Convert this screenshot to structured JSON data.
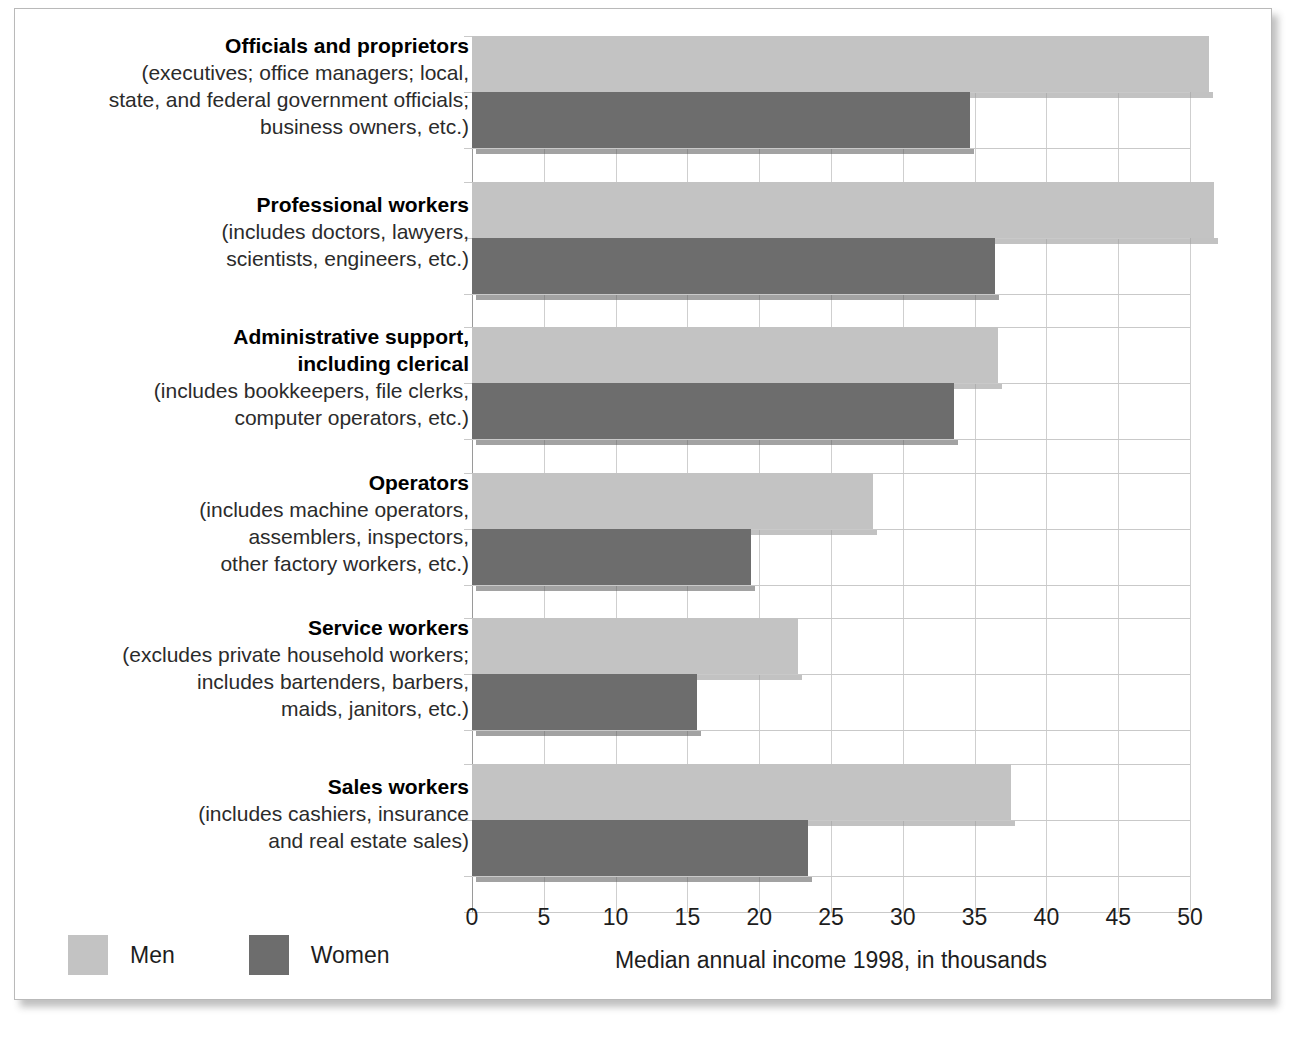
{
  "chart_data": {
    "type": "bar",
    "orientation": "horizontal",
    "title": "",
    "xlabel": "Median annual income 1998, in thousands",
    "ylabel": "",
    "xlim": [
      0,
      52.5
    ],
    "xticks": [
      0,
      5,
      10,
      15,
      20,
      25,
      30,
      35,
      40,
      45,
      50
    ],
    "xticklabels": [
      "0",
      "5",
      "10",
      "15",
      "20",
      "25",
      "30",
      "35",
      "40",
      "45",
      "50"
    ],
    "grid": "vertical",
    "legend_position": "bottom-left",
    "categories": [
      "Officials and proprietors",
      "Professional workers",
      "Administrative support, including clerical",
      "Operators",
      "Service workers",
      "Sales workers"
    ],
    "series": [
      {
        "name": "Men",
        "color": "#c3c3c3",
        "values": [
          51.3,
          51.7,
          36.6,
          27.9,
          22.7,
          37.5
        ]
      },
      {
        "name": "Women",
        "color": "#6d6d6d",
        "values": [
          34.7,
          36.4,
          33.6,
          19.4,
          15.7,
          23.4
        ]
      }
    ]
  },
  "axis": {
    "xlabel": "Median annual income 1998, in thousands",
    "ticks": [
      "0",
      "5",
      "10",
      "15",
      "20",
      "25",
      "30",
      "35",
      "40",
      "45",
      "50"
    ]
  },
  "legend": {
    "items": [
      {
        "label": "Men",
        "swatch": "men-swatch"
      },
      {
        "label": "Women",
        "swatch": "women-swatch"
      }
    ]
  },
  "rows": [
    {
      "title": "Officials and proprietors",
      "sub": [
        "(executives; office managers; local,",
        "state, and federal government officials;",
        "business owners, etc.)"
      ],
      "men": 51.3,
      "women": 34.7
    },
    {
      "title": "Professional workers",
      "sub": [
        "(includes doctors, lawyers,",
        "scientists, engineers, etc.)"
      ],
      "men": 51.7,
      "women": 36.4
    },
    {
      "title": "Administrative support,",
      "title2": "including clerical",
      "sub": [
        "(includes bookkeepers, file clerks,",
        "computer operators, etc.)"
      ],
      "men": 36.6,
      "women": 33.6
    },
    {
      "title": "Operators",
      "sub": [
        "(includes machine operators,",
        "assemblers, inspectors,",
        "other factory workers, etc.)"
      ],
      "men": 27.9,
      "women": 19.4
    },
    {
      "title": "Service workers",
      "sub": [
        "(excludes private household workers;",
        "includes bartenders, barbers,",
        "maids, janitors, etc.)"
      ],
      "men": 22.7,
      "women": 15.7
    },
    {
      "title": "Sales workers",
      "sub": [
        "(includes cashiers, insurance",
        "and real estate sales)"
      ],
      "men": 37.5,
      "women": 23.4
    }
  ]
}
